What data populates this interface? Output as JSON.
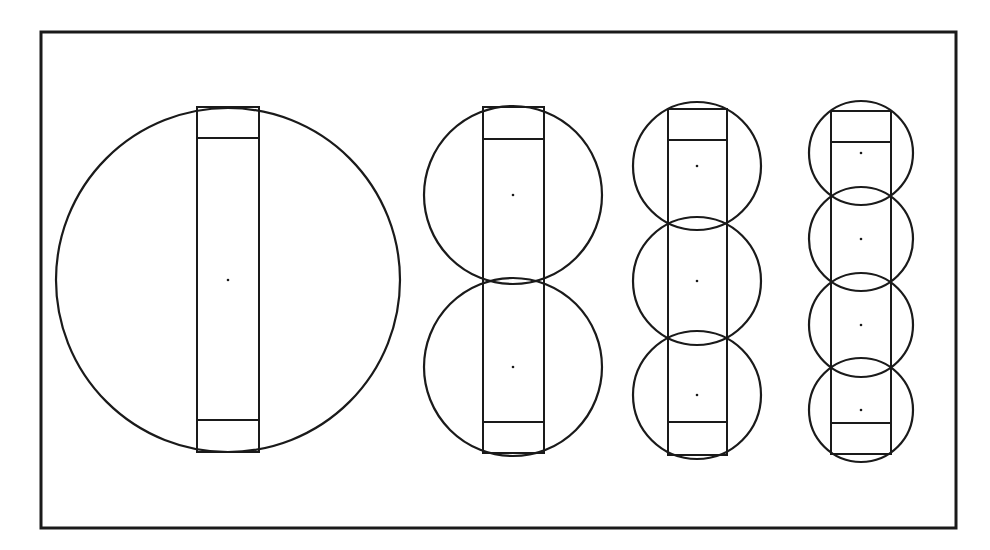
{
  "figure": {
    "description": "Decomposition of a rectangle covered by 1, 2, 3 and 4 equal circles",
    "frame": {
      "x": 41,
      "y": 32,
      "width": 915,
      "height": 496,
      "color": "#1a1a1a"
    },
    "groups": [
      {
        "name": "one-circle",
        "count": 1,
        "rect": {
          "x": 197,
          "y": 107,
          "width": 62,
          "height": 345,
          "bar_top": 138,
          "bar_bottom": 420
        },
        "circles": [
          {
            "cx": 228,
            "cy": 280,
            "r": 172
          }
        ]
      },
      {
        "name": "two-circles",
        "count": 2,
        "rect": {
          "x": 483,
          "y": 107,
          "width": 61,
          "height": 346,
          "bar_top": 139,
          "bar_bottom": 422
        },
        "circles": [
          {
            "cx": 513,
            "cy": 195,
            "r": 89
          },
          {
            "cx": 513,
            "cy": 367,
            "r": 89
          }
        ]
      },
      {
        "name": "three-circles",
        "count": 3,
        "rect": {
          "x": 668,
          "y": 109,
          "width": 59,
          "height": 346,
          "bar_top": 140,
          "bar_bottom": 422
        },
        "circles": [
          {
            "cx": 697,
            "cy": 166,
            "r": 64
          },
          {
            "cx": 697,
            "cy": 281,
            "r": 64
          },
          {
            "cx": 697,
            "cy": 395,
            "r": 64
          }
        ]
      },
      {
        "name": "four-circles",
        "count": 4,
        "rect": {
          "x": 831,
          "y": 111,
          "width": 60,
          "height": 343,
          "bar_top": 142,
          "bar_bottom": 423
        },
        "circles": [
          {
            "cx": 861,
            "cy": 153,
            "r": 52
          },
          {
            "cx": 861,
            "cy": 239,
            "r": 52
          },
          {
            "cx": 861,
            "cy": 325,
            "r": 52
          },
          {
            "cx": 861,
            "cy": 410,
            "r": 52
          }
        ]
      }
    ],
    "stroke_color": "#1a1a1a",
    "background": "#ffffff"
  }
}
